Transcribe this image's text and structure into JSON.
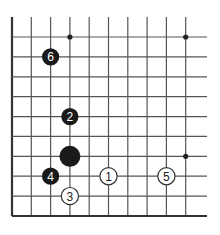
{
  "diagram": {
    "type": "go-board-fragment",
    "edges": {
      "left": true,
      "bottom": true,
      "top": false,
      "right": false
    },
    "grid": {
      "columns_x": [
        12,
        31.3,
        50.6,
        69.9,
        89.2,
        108.5,
        127.8,
        147.1,
        166.4,
        185.7
      ],
      "rows_y": [
        37,
        56.9,
        76.8,
        96.7,
        116.6,
        136.4,
        156.3,
        176.2,
        196.1,
        216
      ],
      "top_extent_y": 17,
      "right_extent_x": 207,
      "line_color": "#555555",
      "edge_color": "#333333"
    },
    "star_points": [
      {
        "col": 3,
        "row": 0
      },
      {
        "col": 9,
        "row": 0
      },
      {
        "col": 9,
        "row": 6
      }
    ],
    "stones": [
      {
        "color": "black",
        "label": "",
        "col": 3,
        "row": 6,
        "large": true
      },
      {
        "color": "white",
        "label": "1",
        "col": 5,
        "row": 7
      },
      {
        "color": "black",
        "label": "2",
        "col": 3,
        "row": 4
      },
      {
        "color": "white",
        "label": "3",
        "col": 3,
        "row": 8
      },
      {
        "color": "black",
        "label": "4",
        "col": 2,
        "row": 7
      },
      {
        "color": "white",
        "label": "5",
        "col": 8,
        "row": 7
      },
      {
        "color": "black",
        "label": "6",
        "col": 2,
        "row": 1
      }
    ],
    "colors": {
      "black_stone": "#1a1a1a",
      "white_stone": "#ffffff",
      "white_outline": "#333333",
      "black_label": "#ffffff",
      "white_label": "#222222"
    }
  }
}
